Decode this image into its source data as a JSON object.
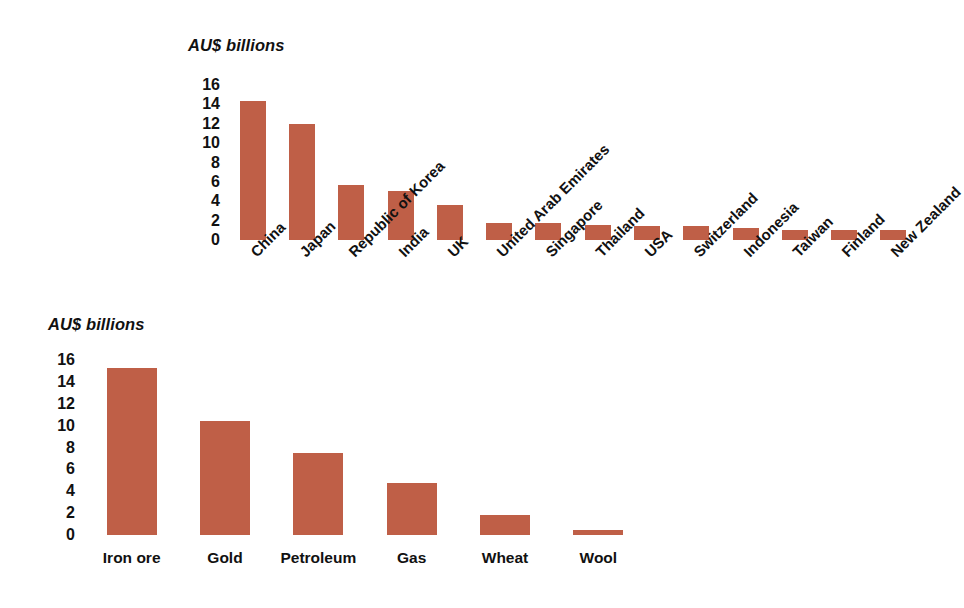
{
  "chart_data": [
    {
      "id": "exports-by-destination",
      "type": "bar",
      "title": "",
      "axis_title": "AU$ billions",
      "xlabel": "",
      "ylabel": "AU$ billions",
      "ylim": [
        0,
        16
      ],
      "yticks": [
        16,
        14,
        12,
        10,
        8,
        6,
        4,
        2,
        0
      ],
      "grid": false,
      "legend": "none",
      "bar_color": "#bf5f47",
      "categories": [
        "China",
        "Japan",
        "Republic of Korea",
        "India",
        "UK",
        "United Arab Emirates",
        "Singapore",
        "Thailand",
        "USA",
        "Switzerland",
        "Indonesia",
        "Taiwan",
        "Finland",
        "New Zealand"
      ],
      "values": [
        14.4,
        12.0,
        5.7,
        5.1,
        3.6,
        1.8,
        1.8,
        1.6,
        1.4,
        1.4,
        1.2,
        1.0,
        1.0,
        1.0
      ]
    },
    {
      "id": "exports-by-commodity",
      "type": "bar",
      "title": "",
      "axis_title": "AU$ billions",
      "xlabel": "",
      "ylabel": "AU$ billions",
      "ylim": [
        0,
        16
      ],
      "yticks": [
        16,
        14,
        12,
        10,
        8,
        6,
        4,
        2,
        0
      ],
      "grid": false,
      "legend": "none",
      "bar_color": "#bf5f47",
      "categories": [
        "Iron ore",
        "Gold",
        "Petroleum",
        "Gas",
        "Wheat",
        "Wool"
      ],
      "values": [
        15.3,
        10.4,
        7.5,
        4.8,
        1.8,
        0.5
      ]
    }
  ]
}
